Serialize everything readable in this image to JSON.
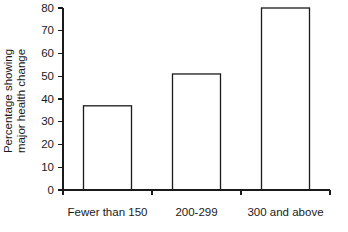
{
  "chart_data": {
    "type": "bar",
    "title": "",
    "xlabel": "",
    "ylabel": "Percentage showing major health change",
    "ylabel_line1": "Percentage showing",
    "ylabel_line2": "major health change",
    "categories": [
      "Fewer than 150",
      "200-299",
      "300 and above"
    ],
    "values": [
      37,
      51,
      80
    ],
    "ylim": [
      0,
      80
    ],
    "yticks": [
      0,
      10,
      20,
      30,
      40,
      50,
      60,
      70,
      80
    ],
    "ytick_labels": [
      "0",
      "10",
      "20",
      "30",
      "40",
      "50",
      "60",
      "70",
      "80"
    ],
    "grid": false,
    "legend": null,
    "bar_fill": "horizontal-hatch",
    "bar_fill_color": "#ffffff",
    "bar_edge_color": "#1a1a1a",
    "background_color": "#ffffff"
  }
}
